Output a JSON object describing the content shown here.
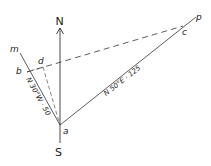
{
  "diagram": {
    "type": "survey-traverse",
    "colors": {
      "line": "#333333",
      "background": "#ffffff"
    },
    "compass": {
      "north_label": "N",
      "south_label": "S"
    },
    "points": {
      "a": {
        "label": "a",
        "x": 60,
        "y": 125
      },
      "b": {
        "label": "b",
        "x": 27,
        "y": 72
      },
      "c": {
        "label": "c",
        "x": 183,
        "y": 26
      },
      "d": {
        "label": "d",
        "x": 43,
        "y": 67
      },
      "m": {
        "label": "m",
        "x": 20,
        "y": 53
      },
      "p": {
        "label": "p",
        "x": 196,
        "y": 17
      }
    },
    "lines": {
      "am": {
        "bearing_label": "N 30°W · 50",
        "style": "solid"
      },
      "ap": {
        "bearing_label": "N 50°E · 125",
        "style": "solid"
      },
      "bc": {
        "style": "dashed"
      },
      "da": {
        "style": "dashed"
      },
      "bd": {
        "style": "dashed"
      }
    }
  }
}
